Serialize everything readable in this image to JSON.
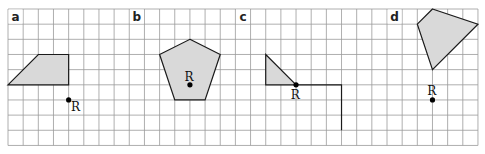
{
  "grid": {
    "origin_x": 8,
    "origin_y": 9,
    "cell": 15.16,
    "cols": 31,
    "rows": 9,
    "line_color": "#9a9a9a"
  },
  "colors": {
    "shape_fill": "#d9d9d9",
    "stroke": "#1a1a1a"
  },
  "panels": [
    {
      "label": "a",
      "label_cell": [
        0,
        0
      ],
      "shape": [
        [
          0,
          5
        ],
        [
          2,
          3
        ],
        [
          4,
          3
        ],
        [
          4,
          5
        ]
      ],
      "point": {
        "name": "R",
        "at": [
          4,
          6
        ],
        "label_offset": [
          0.15,
          0.75
        ]
      }
    },
    {
      "label": "b",
      "label_cell": [
        8,
        0
      ],
      "shape": [
        [
          12,
          2
        ],
        [
          14,
          3
        ],
        [
          13,
          6
        ],
        [
          11,
          6
        ],
        [
          10,
          3
        ]
      ],
      "point": {
        "name": "R",
        "at": [
          12,
          5
        ],
        "label_offset": [
          -0.35,
          -0.25
        ]
      }
    },
    {
      "label": "c",
      "label_cell": [
        15,
        0
      ],
      "shape": [
        [
          17,
          3
        ],
        [
          19,
          5
        ],
        [
          17,
          5
        ]
      ],
      "point": {
        "name": "R",
        "at": [
          19,
          5
        ],
        "label_offset": [
          -0.35,
          0.95
        ]
      },
      "path": [
        [
          19,
          5
        ],
        [
          22,
          5
        ],
        [
          22,
          8
        ]
      ]
    },
    {
      "label": "d",
      "label_cell": [
        25,
        0
      ],
      "shape": [
        [
          28,
          0
        ],
        [
          31,
          1
        ],
        [
          28,
          4
        ],
        [
          27,
          1
        ]
      ],
      "point": {
        "name": "R",
        "at": [
          28,
          6
        ],
        "label_offset": [
          -0.35,
          -0.3
        ]
      }
    }
  ]
}
